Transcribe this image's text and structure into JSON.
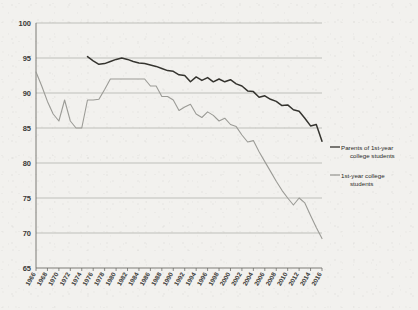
{
  "chart_data": {
    "type": "line",
    "title": "",
    "subtitle": "",
    "xlabel": "",
    "ylabel": "",
    "xlim": [
      1966,
      2016
    ],
    "ylim": [
      65,
      100
    ],
    "grid": true,
    "grid_axis": "y",
    "legend_position": "right",
    "y_ticks": [
      65,
      70,
      75,
      80,
      85,
      90,
      95,
      100
    ],
    "x_ticks": [
      1966,
      1968,
      1970,
      1972,
      1974,
      1976,
      1978,
      1980,
      1982,
      1984,
      1986,
      1988,
      1990,
      1992,
      1994,
      1996,
      1998,
      2000,
      2002,
      2004,
      2006,
      2008,
      2010,
      2012,
      2014,
      2016
    ],
    "x_tick_labels": [
      "1966",
      "1968",
      "1970",
      "1972",
      "1974",
      "1976",
      "1978",
      "1980",
      "1982",
      "1984",
      "1986",
      "1988",
      "1990",
      "1992",
      "1994",
      "1996",
      "1998",
      "2000",
      "2002",
      "2004",
      "2006",
      "2008",
      "2010",
      "2012",
      "2014",
      "2016"
    ],
    "series": [
      {
        "name": "Parents of 1st-year college students",
        "color": "#35342f",
        "x": [
          1975,
          1976,
          1977,
          1978,
          1979,
          1980,
          1981,
          1982,
          1983,
          1984,
          1985,
          1986,
          1987,
          1988,
          1989,
          1990,
          1991,
          1992,
          1993,
          1994,
          1995,
          1996,
          1997,
          1998,
          1999,
          2000,
          2001,
          2002,
          2003,
          2004,
          2005,
          2006,
          2007,
          2008,
          2009,
          2010,
          2011,
          2012,
          2013,
          2014,
          2015,
          2016
        ],
        "values": [
          95.2,
          94.6,
          94.1,
          94.2,
          94.5,
          94.8,
          95.0,
          94.8,
          94.5,
          94.3,
          94.2,
          94.0,
          93.8,
          93.5,
          93.2,
          93.1,
          92.6,
          92.5,
          91.6,
          92.3,
          91.8,
          92.2,
          91.6,
          92.0,
          91.6,
          91.9,
          91.3,
          91.0,
          90.3,
          90.2,
          89.4,
          89.6,
          89.1,
          88.8,
          88.2,
          88.3,
          87.6,
          87.4,
          86.4,
          85.3,
          85.5,
          83.1
        ]
      },
      {
        "name": "1st-year college students",
        "color": "#9b9b96",
        "x": [
          1966,
          1967,
          1968,
          1969,
          1970,
          1971,
          1972,
          1973,
          1974,
          1975,
          1976,
          1977,
          1978,
          1979,
          1980,
          1981,
          1982,
          1983,
          1984,
          1985,
          1986,
          1987,
          1988,
          1989,
          1990,
          1991,
          1992,
          1993,
          1994,
          1995,
          1996,
          1997,
          1998,
          1999,
          2000,
          2001,
          2002,
          2003,
          2004,
          2005,
          2006,
          2007,
          2008,
          2009,
          2010,
          2011,
          2012,
          2013,
          2014,
          2015,
          2016
        ],
        "values": [
          93.0,
          91.0,
          88.8,
          87.0,
          86.0,
          89.0,
          86.0,
          85.0,
          85.0,
          89.0,
          89.0,
          89.1,
          90.5,
          92.0,
          92.0,
          92.0,
          92.0,
          92.0,
          92.0,
          92.0,
          91.0,
          91.0,
          89.5,
          89.5,
          89.0,
          87.5,
          88.0,
          88.4,
          87.0,
          86.5,
          87.3,
          86.8,
          86.0,
          86.4,
          85.5,
          85.2,
          84.0,
          83.0,
          83.2,
          81.6,
          80.2,
          78.8,
          77.4,
          76.1,
          75.0,
          74.0,
          75.0,
          74.3,
          72.5,
          70.8,
          69.2
        ]
      }
    ],
    "legend": [
      {
        "label_line1": "Parents of 1st-year",
        "label_line2": "college students",
        "color": "#35342f"
      },
      {
        "label_line1": "1st-year college",
        "label_line2": "students",
        "color": "#9b9b96"
      }
    ]
  },
  "colors": {
    "background": "#f2f1ee",
    "grid": "#a9a9a4",
    "axis": "#6d6d68",
    "series_dark": "#35342f",
    "series_gray": "#9b9b96",
    "text": "#3a3a38"
  }
}
